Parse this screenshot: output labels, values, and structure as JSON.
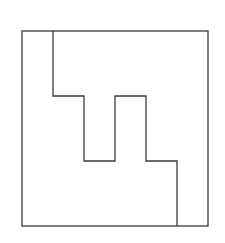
{
  "diagram": {
    "title": "",
    "stroke_color": "#3a3a3a",
    "stroke_width": 1.3,
    "background": "#ffffff",
    "outer_square": {
      "x": 22,
      "y": 31,
      "width": 186,
      "height": 195
    },
    "divider_path": [
      [
        53,
        31
      ],
      [
        53,
        96
      ],
      [
        84,
        96
      ],
      [
        84,
        161
      ],
      [
        115,
        161
      ],
      [
        115,
        96
      ],
      [
        146,
        96
      ],
      [
        146,
        161
      ],
      [
        177,
        161
      ],
      [
        177,
        226
      ]
    ],
    "regions": [
      {
        "name": "left-lower-region"
      },
      {
        "name": "right-upper-region"
      }
    ]
  }
}
